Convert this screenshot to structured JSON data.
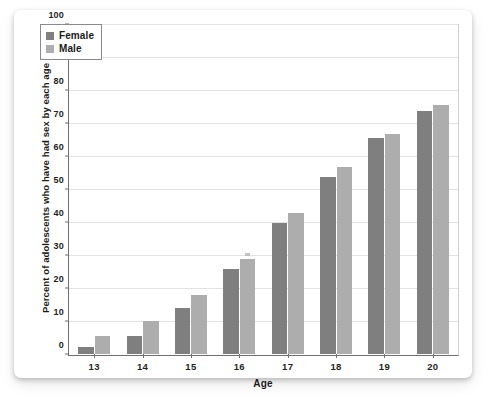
{
  "chart_data": {
    "type": "bar",
    "title": "",
    "xlabel": "Age",
    "ylabel": "Percent of adolescents who have had sex by each age",
    "categories": [
      "13",
      "14",
      "15",
      "16",
      "17",
      "18",
      "19",
      "20"
    ],
    "series": [
      {
        "name": "Female",
        "color": "#7f7f7f",
        "values": [
          2,
          5.5,
          14,
          26,
          40,
          54,
          66,
          74
        ]
      },
      {
        "name": "Male",
        "color": "#adadad",
        "values": [
          5.5,
          10,
          18,
          29,
          43,
          57,
          67,
          76
        ]
      }
    ],
    "ylim": [
      0,
      100
    ],
    "yticks": [
      0,
      10,
      20,
      30,
      40,
      50,
      60,
      70,
      80,
      90,
      100
    ],
    "ytick_labels": [
      "0",
      "10",
      "20",
      "30",
      "40",
      "50",
      "60",
      "70",
      "80",
      "90",
      "100"
    ],
    "grid": true,
    "legend_position": "top-left"
  },
  "legend": {
    "entries": [
      {
        "label": "Female",
        "color": "#7f7f7f"
      },
      {
        "label": "Male",
        "color": "#adadad"
      }
    ]
  },
  "colors": {
    "female": "#7f7f7f",
    "male": "#adadad",
    "grid": "#e2e2e2",
    "axis": "#6f6f6f",
    "card": "#ffffff"
  }
}
